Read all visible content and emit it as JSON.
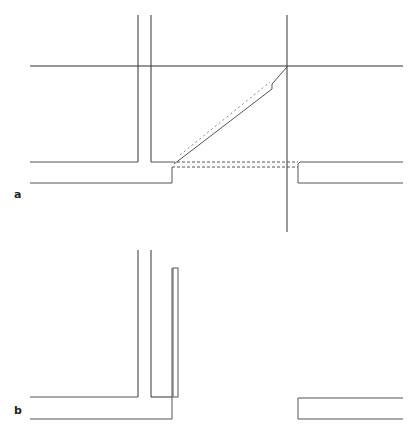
{
  "figure": {
    "panels": [
      {
        "label": "a",
        "description": "Plan view of wall junction with diagonal fold and dashed hidden lines"
      },
      {
        "label": "b",
        "description": "Plan view of wall junction with inserted narrow panel"
      }
    ]
  }
}
